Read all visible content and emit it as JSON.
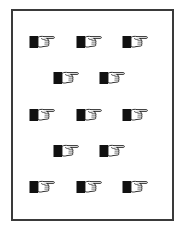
{
  "card": {
    "border_color": "#3a3a3a",
    "background": "#ffffff"
  },
  "symbol": {
    "name": "pointing-hand-icon",
    "direction": "right",
    "count": 13
  },
  "rows": [
    {
      "y": 35,
      "x": [
        29,
        76,
        122
      ]
    },
    {
      "y": 71,
      "x": [
        53,
        99
      ]
    },
    {
      "y": 108,
      "x": [
        29,
        76,
        122
      ]
    },
    {
      "y": 144,
      "x": [
        53,
        99
      ]
    },
    {
      "y": 180,
      "x": [
        29,
        76,
        122
      ]
    }
  ]
}
